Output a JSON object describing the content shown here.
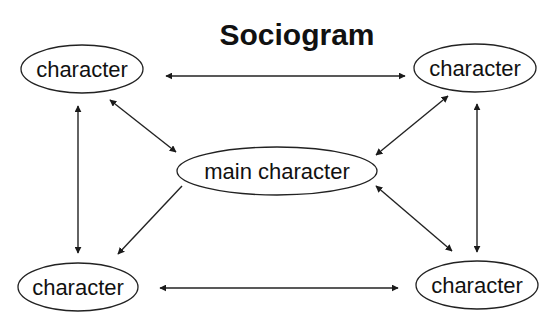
{
  "title": "Sociogram",
  "colors": {
    "background": "#ffffff",
    "ink": "#222222"
  },
  "nodes": [
    {
      "id": "top-left",
      "label": "character",
      "cx": 82,
      "cy": 69,
      "rx": 61,
      "ry": 24
    },
    {
      "id": "top-right",
      "label": "character",
      "cx": 475,
      "cy": 68,
      "rx": 61,
      "ry": 24
    },
    {
      "id": "center",
      "label": "main character",
      "cx": 277,
      "cy": 171,
      "rx": 100,
      "ry": 24
    },
    {
      "id": "bottom-left",
      "label": "character",
      "cx": 78,
      "cy": 287,
      "rx": 60,
      "ry": 24
    },
    {
      "id": "bottom-right",
      "label": "character",
      "cx": 477,
      "cy": 285,
      "rx": 61,
      "ry": 24
    }
  ],
  "edges": [
    {
      "from": "top-left",
      "to": "top-right",
      "direction": "both",
      "x1": 166,
      "y1": 76,
      "x2": 405,
      "y2": 76
    },
    {
      "from": "bottom-left",
      "to": "bottom-right",
      "direction": "both",
      "x1": 160,
      "y1": 288,
      "x2": 398,
      "y2": 288
    },
    {
      "from": "top-left",
      "to": "bottom-left",
      "direction": "both",
      "x1": 78,
      "y1": 106,
      "x2": 78,
      "y2": 253
    },
    {
      "from": "top-right",
      "to": "bottom-right",
      "direction": "both",
      "x1": 477,
      "y1": 104,
      "x2": 477,
      "y2": 252
    },
    {
      "from": "top-left",
      "to": "center",
      "direction": "both",
      "x1": 110,
      "y1": 100,
      "x2": 176,
      "y2": 152
    },
    {
      "from": "top-right",
      "to": "center",
      "direction": "both",
      "x1": 448,
      "y1": 96,
      "x2": 376,
      "y2": 155
    },
    {
      "from": "center",
      "to": "bottom-left",
      "direction": "forward",
      "x1": 182,
      "y1": 186,
      "x2": 118,
      "y2": 254
    },
    {
      "from": "center",
      "to": "bottom-right",
      "direction": "both",
      "x1": 376,
      "y1": 186,
      "x2": 452,
      "y2": 251
    }
  ]
}
